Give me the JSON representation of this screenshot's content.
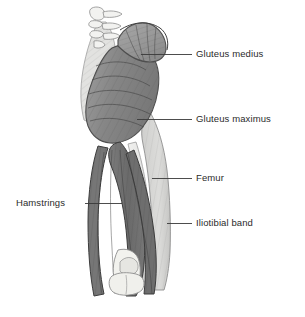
{
  "figure": {
    "background_color": "#ffffff",
    "line_color": "#333333",
    "text_color": "#2b2b2b",
    "palette": {
      "bone_light": "#eeeeec",
      "bone_outline": "#8d8d8d",
      "gluteus_medius": "#9a9a9a",
      "gluteus_maximus": "#8a8a8a",
      "hamstrings": "#707070",
      "iliotibial_band": "#d8d8d6",
      "femur": "#e8e8e6",
      "pelvis": "#dcdcda"
    }
  },
  "labels": [
    {
      "id": "gluteus-medius",
      "text": "Gluteus medius",
      "side": "right",
      "text_x": 196,
      "text_y": 49,
      "leader": {
        "x1": 141,
        "y1": 54,
        "x2": 192,
        "y2": 54
      }
    },
    {
      "id": "gluteus-maximus",
      "text": "Gluteus maximus",
      "side": "right",
      "text_x": 196,
      "text_y": 114,
      "leader": {
        "x1": 137,
        "y1": 119,
        "x2": 192,
        "y2": 119
      }
    },
    {
      "id": "femur",
      "text": "Femur",
      "side": "right",
      "text_x": 196,
      "text_y": 173,
      "leader": {
        "x1": 152,
        "y1": 178,
        "x2": 192,
        "y2": 178
      }
    },
    {
      "id": "iliotibial-band",
      "text": "Iliotibial band",
      "side": "right",
      "text_x": 196,
      "text_y": 218,
      "leader": {
        "x1": 167,
        "y1": 223,
        "x2": 192,
        "y2": 223
      }
    },
    {
      "id": "hamstrings",
      "text": "Hamstrings",
      "side": "left",
      "text_x": 16,
      "text_y": 198,
      "leader": {
        "x1": 85,
        "y1": 203,
        "x2": 122,
        "y2": 203
      }
    }
  ],
  "anatomy": {
    "structures": [
      {
        "id": "vertebrae",
        "name": "Lumbar vertebrae",
        "tone": "bone_light"
      },
      {
        "id": "pelvis",
        "name": "Ilium / pelvis",
        "tone": "pelvis"
      },
      {
        "id": "gluteus-medius",
        "name": "Gluteus medius",
        "tone": "gluteus_medius"
      },
      {
        "id": "gluteus-maximus",
        "name": "Gluteus maximus",
        "tone": "gluteus_maximus"
      },
      {
        "id": "iliotibial-band",
        "name": "Iliotibial band",
        "tone": "iliotibial_band"
      },
      {
        "id": "femur",
        "name": "Femur",
        "tone": "femur"
      },
      {
        "id": "hamstrings",
        "name": "Hamstrings",
        "tone": "hamstrings"
      },
      {
        "id": "knee-bones",
        "name": "Femoral condyles / knee",
        "tone": "bone_light"
      }
    ]
  }
}
